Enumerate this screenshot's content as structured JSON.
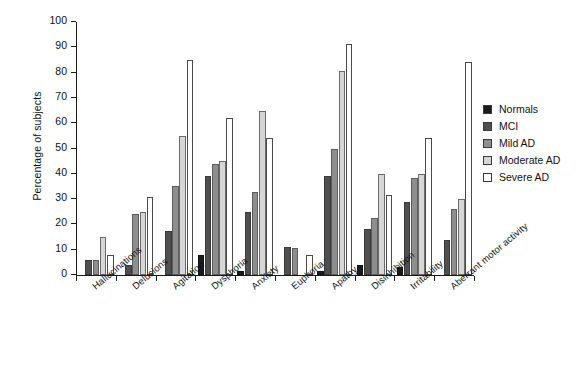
{
  "chart_data": {
    "type": "bar",
    "title": "",
    "xlabel": "",
    "ylabel": "Percentage of subjects",
    "ylim": [
      0,
      100
    ],
    "yticks": [
      0,
      10,
      20,
      30,
      40,
      50,
      60,
      70,
      80,
      90,
      100
    ],
    "grid": false,
    "legend_position": "right",
    "categories": [
      "Hallucinations",
      "Delusions",
      "Agitation",
      "Dysphoria",
      "Anxiety",
      "Euphoria",
      "Apathy",
      "Disinhibition",
      "Irritability",
      "Aberrant motor activity"
    ],
    "series": [
      {
        "name": "Normals",
        "color": "#1b1b1b",
        "values": [
          0,
          0,
          0,
          8,
          1.5,
          0,
          1.5,
          4,
          3,
          0
        ]
      },
      {
        "name": "MCI",
        "color": "#4f4f4f",
        "values": [
          6,
          4,
          17.5,
          39,
          25,
          11,
          39,
          18,
          29,
          14
        ]
      },
      {
        "name": "Mild AD",
        "color": "#8e8e8e",
        "values": [
          6,
          24,
          35,
          44,
          33,
          10.5,
          50,
          22.5,
          38.5,
          26
        ]
      },
      {
        "name": "Moderate AD",
        "color": "#d6d6d6",
        "values": [
          15,
          25,
          55,
          45,
          65,
          0,
          80.5,
          40,
          40,
          30
        ]
      },
      {
        "name": "Severe AD",
        "color": "#ffffff",
        "values": [
          8,
          31,
          85,
          62,
          54,
          8,
          91.5,
          31.5,
          54,
          84
        ]
      }
    ]
  },
  "legend": {
    "items": [
      {
        "label": "Normals"
      },
      {
        "label": "MCI"
      },
      {
        "label": "Mild AD"
      },
      {
        "label": "Moderate AD"
      },
      {
        "label": "Severe AD"
      }
    ]
  }
}
